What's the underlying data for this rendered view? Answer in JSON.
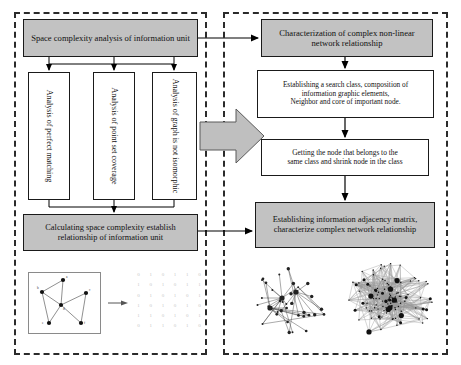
{
  "diagram": {
    "type": "flowchart",
    "panels": [
      {
        "id": "left",
        "name": "space-complexity-analysis-panel",
        "border_style": "dashed"
      },
      {
        "id": "right",
        "name": "network-relationship-panel",
        "border_style": "dashed"
      }
    ],
    "colors": {
      "box_fill_gray": "#c2c2c2",
      "box_fill_white": "#ffffff",
      "border": "#1a1a1a",
      "panel_border": "#2b2b2b",
      "arrow": "#000000",
      "block_arrow_fill": "#bfbfbf",
      "matrix_text": "#c8c8c8"
    }
  },
  "left_panel": {
    "header_box": {
      "label": "Space complexity analysis of information unit",
      "fill": "gray"
    },
    "branch_boxes": [
      {
        "label": "Analysis of perfect matching",
        "fill": "white",
        "orientation": "vertical"
      },
      {
        "label": "Analysis of point set coverage",
        "fill": "white",
        "orientation": "vertical"
      },
      {
        "label": "Analysis of graph is not isomorphic",
        "fill": "white",
        "orientation": "vertical"
      }
    ],
    "footer_box": {
      "label": "Calculating space complexity establish relationship of information unit",
      "fill": "gray"
    },
    "illustration": {
      "graph_caption": "",
      "node_labels": [
        "a",
        "b",
        "c",
        "d",
        "e",
        "f"
      ],
      "matrix_rows": [
        [
          "0",
          "1",
          "0",
          "1",
          "1",
          "0"
        ],
        [
          "1",
          "0",
          "1",
          "0",
          "1",
          "1"
        ],
        [
          "0",
          "1",
          "0",
          "1",
          "0",
          "1"
        ],
        [
          "1",
          "0",
          "1",
          "0",
          "1",
          "0"
        ],
        [
          "1",
          "1",
          "0",
          "1",
          "0",
          "1"
        ],
        [
          "0",
          "1",
          "1",
          "0",
          "1",
          "0"
        ]
      ]
    }
  },
  "right_panel": {
    "header_box": {
      "label": "Characterization of complex non-linear network relationship",
      "fill": "gray"
    },
    "step_boxes": [
      {
        "lines": [
          "Establishing a search class, composition of",
          "information graphic elements,",
          "Neighbor and core of important node."
        ],
        "fill": "white"
      },
      {
        "lines": [
          "Getting the node that belongs to the",
          "same class and shrink node in the class"
        ],
        "fill": "white"
      }
    ],
    "footer_box": {
      "label": "Establishing information adjacency matrix, characterize complex network relationship",
      "fill": "gray"
    },
    "illustration": {
      "left_graphic": "sparse-network-graph",
      "right_graphic": "dense-network-graph"
    }
  },
  "connectors": {
    "block_arrow": {
      "name": "left-to-right-block-arrow",
      "direction": "right"
    },
    "top_link": {
      "name": "header-to-header-arrow",
      "direction": "right"
    },
    "bottom_link": {
      "name": "footer-to-footer-arrow",
      "direction": "right"
    },
    "illustration_link": {
      "name": "graph-to-matrix-arrow",
      "direction": "right"
    }
  }
}
